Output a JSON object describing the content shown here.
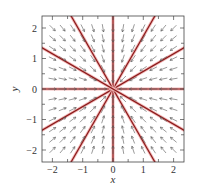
{
  "chart_data": {
    "type": "quiver",
    "title": "",
    "xlabel": "x",
    "ylabel": "y",
    "xlim": [
      -2.35,
      2.35
    ],
    "ylim": [
      -2.4,
      2.4
    ],
    "xticks": [
      -2,
      -1,
      0,
      1,
      2
    ],
    "yticks": [
      -2,
      -1,
      0,
      1,
      2
    ],
    "xtick_labels": [
      "−2",
      "−1",
      "0",
      "1",
      "2"
    ],
    "ytick_labels": [
      "−2",
      "−1",
      "0",
      "1",
      "2"
    ],
    "minor_ticks_step": 0.5,
    "grid": false,
    "vector_field": {
      "dx_dt": "-x",
      "dy_dt": "-y",
      "description": "All arrows point toward origin (stable star node)",
      "grid_step": 0.333,
      "grid_range": [
        -2,
        2
      ],
      "arrow_color": "#555555"
    },
    "trajectories": {
      "description": "Straight-line solutions through origin",
      "angles_deg": [
        0,
        30,
        60,
        90,
        120,
        150
      ],
      "color": "#8b1a1a",
      "halo_color": "#f2b8b8"
    },
    "equilibrium": {
      "x": 0,
      "y": 0,
      "type": "stable star node"
    }
  }
}
